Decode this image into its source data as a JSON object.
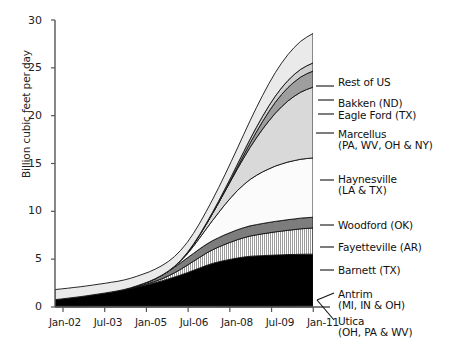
{
  "chart_data": {
    "type": "area",
    "stacked": true,
    "title": "",
    "xlabel": "",
    "ylabel": "Billion cubic feet per day",
    "ylim": [
      0,
      30
    ],
    "yticks": [
      0,
      5,
      10,
      15,
      20,
      25,
      30
    ],
    "ytick_labels": [
      "0",
      "5",
      "10",
      "15",
      "20",
      "25",
      "30"
    ],
    "xticks": [
      "Jan-02",
      "Jul-03",
      "Jan-05",
      "Jul-06",
      "Jan-08",
      "Jul-09",
      "Jan-11"
    ],
    "xtick_labels": [
      "Jan-02",
      "Jul-03",
      "Jan-05",
      "Jul-06",
      "Jan-08",
      "Jul-09",
      "Jan-11"
    ],
    "x_start": "Jan-02",
    "x_end": "Jul-12",
    "x_points": 42,
    "grid": false,
    "legend_position": "right-callout",
    "units": "Billion cubic feet per day",
    "series": [
      {
        "name": "Antrim (MI, IN & OH)",
        "label": "Antrim",
        "sublabel": "(MI, IN & OH)",
        "color": "#f2f2f2",
        "pattern": "solid",
        "values": [
          0.12,
          0.12,
          0.12,
          0.12,
          0.12,
          0.12,
          0.13,
          0.13,
          0.13,
          0.13,
          0.13,
          0.13,
          0.13,
          0.13,
          0.13,
          0.13,
          0.13,
          0.13,
          0.13,
          0.13,
          0.13,
          0.13,
          0.13,
          0.13,
          0.13,
          0.13,
          0.12,
          0.12,
          0.12,
          0.12,
          0.12,
          0.12,
          0.12,
          0.12,
          0.12,
          0.12,
          0.12,
          0.12,
          0.11,
          0.11,
          0.11,
          0.11
        ]
      },
      {
        "name": "Utica (OH, PA & WV)",
        "label": "Utica",
        "sublabel": "(OH, PA & WV)",
        "color": "#fafafa",
        "pattern": "solid",
        "values": [
          0,
          0,
          0,
          0,
          0,
          0,
          0,
          0,
          0,
          0,
          0,
          0,
          0,
          0,
          0,
          0,
          0,
          0,
          0,
          0,
          0,
          0,
          0,
          0,
          0,
          0,
          0,
          0,
          0,
          0,
          0,
          0,
          0,
          0,
          0,
          0.01,
          0.01,
          0.02,
          0.03,
          0.04,
          0.05,
          0.06
        ]
      },
      {
        "name": "Barnett (TX)",
        "label": "Barnett (TX)",
        "sublabel": "",
        "color": "#000000",
        "pattern": "solid",
        "values": [
          0.65,
          0.72,
          0.8,
          0.88,
          0.96,
          1.05,
          1.14,
          1.24,
          1.34,
          1.45,
          1.56,
          1.68,
          1.8,
          1.95,
          2.1,
          2.25,
          2.42,
          2.6,
          2.8,
          3.0,
          3.22,
          3.45,
          3.7,
          3.95,
          4.2,
          4.42,
          4.6,
          4.75,
          4.88,
          5.0,
          5.1,
          5.18,
          5.22,
          5.25,
          5.28,
          5.3,
          5.32,
          5.34,
          5.35,
          5.36,
          5.36,
          5.35
        ]
      },
      {
        "name": "Fayetteville (AR)",
        "label": "Fayetteville (AR)",
        "sublabel": "",
        "color": "#e8e8e8",
        "pattern": "vertical-stripes",
        "values": [
          0,
          0,
          0,
          0,
          0,
          0,
          0,
          0,
          0,
          0,
          0,
          0,
          0.02,
          0.04,
          0.07,
          0.1,
          0.15,
          0.22,
          0.32,
          0.45,
          0.6,
          0.78,
          0.95,
          1.12,
          1.28,
          1.42,
          1.55,
          1.68,
          1.8,
          1.92,
          2.02,
          2.12,
          2.2,
          2.28,
          2.35,
          2.42,
          2.48,
          2.54,
          2.6,
          2.66,
          2.7,
          2.74
        ]
      },
      {
        "name": "Woodford (OK)",
        "label": "Woodford (OK)",
        "sublabel": "",
        "color": "#7d7d7d",
        "pattern": "solid",
        "values": [
          0,
          0,
          0,
          0,
          0,
          0,
          0,
          0,
          0,
          0,
          0,
          0.02,
          0.05,
          0.09,
          0.14,
          0.2,
          0.28,
          0.38,
          0.48,
          0.58,
          0.68,
          0.76,
          0.82,
          0.88,
          0.92,
          0.95,
          0.98,
          1.0,
          1.02,
          1.04,
          1.05,
          1.06,
          1.07,
          1.08,
          1.09,
          1.1,
          1.1,
          1.11,
          1.11,
          1.12,
          1.12,
          1.12
        ]
      },
      {
        "name": "Haynesville (LA & TX)",
        "label": "Haynesville",
        "sublabel": "(LA & TX)",
        "color": "#fbfbfb",
        "pattern": "solid",
        "values": [
          0,
          0,
          0,
          0,
          0,
          0,
          0,
          0,
          0,
          0,
          0,
          0,
          0,
          0,
          0,
          0,
          0,
          0,
          0.02,
          0.08,
          0.2,
          0.42,
          0.75,
          1.15,
          1.6,
          2.1,
          2.62,
          3.15,
          3.65,
          4.1,
          4.5,
          4.85,
          5.15,
          5.4,
          5.6,
          5.78,
          5.92,
          6.02,
          6.1,
          6.15,
          6.18,
          6.2
        ]
      },
      {
        "name": "Marcellus (PA, WV, OH & NY)",
        "label": "Marcellus",
        "sublabel": "(PA, WV, OH & NY)",
        "color": "#d9d9d9",
        "pattern": "solid",
        "values": [
          0,
          0,
          0,
          0,
          0,
          0,
          0,
          0,
          0,
          0,
          0,
          0,
          0,
          0,
          0,
          0,
          0,
          0,
          0,
          0.02,
          0.05,
          0.1,
          0.18,
          0.3,
          0.48,
          0.72,
          1.02,
          1.38,
          1.8,
          2.28,
          2.8,
          3.35,
          3.92,
          4.48,
          5.02,
          5.52,
          5.98,
          6.38,
          6.72,
          7.0,
          7.22,
          7.4
        ]
      },
      {
        "name": "Eagle Ford (TX)",
        "label": "Eagle Ford (TX)",
        "sublabel": "",
        "color": "#9e9e9e",
        "pattern": "solid",
        "values": [
          0,
          0,
          0,
          0,
          0,
          0,
          0,
          0,
          0,
          0,
          0,
          0,
          0,
          0,
          0,
          0,
          0,
          0,
          0,
          0,
          0,
          0,
          0,
          0,
          0,
          0,
          0.02,
          0.05,
          0.1,
          0.18,
          0.3,
          0.45,
          0.62,
          0.8,
          0.98,
          1.14,
          1.28,
          1.4,
          1.5,
          1.58,
          1.64,
          1.68
        ]
      },
      {
        "name": "Bakken (ND)",
        "label": "Bakken (ND)",
        "sublabel": "",
        "color": "#cfcfcf",
        "pattern": "solid",
        "values": [
          0,
          0,
          0,
          0,
          0,
          0,
          0,
          0,
          0,
          0,
          0,
          0,
          0,
          0,
          0,
          0,
          0,
          0,
          0,
          0,
          0.01,
          0.02,
          0.04,
          0.06,
          0.09,
          0.12,
          0.16,
          0.2,
          0.25,
          0.3,
          0.36,
          0.42,
          0.48,
          0.54,
          0.6,
          0.65,
          0.7,
          0.74,
          0.78,
          0.81,
          0.83,
          0.85
        ]
      },
      {
        "name": "Rest of US",
        "label": "Rest of US",
        "sublabel": "",
        "color": "#eaeaea",
        "pattern": "solid",
        "values": [
          1.05,
          1.05,
          1.04,
          1.04,
          1.03,
          1.03,
          1.02,
          1.02,
          1.01,
          1.01,
          1.0,
          1.0,
          1.0,
          1.0,
          1.0,
          1.0,
          1.0,
          1.0,
          1.0,
          1.02,
          1.05,
          1.08,
          1.12,
          1.18,
          1.25,
          1.32,
          1.4,
          1.48,
          1.58,
          1.68,
          1.8,
          1.92,
          2.05,
          2.18,
          2.32,
          2.45,
          2.58,
          2.7,
          2.82,
          2.92,
          3.0,
          3.08
        ]
      }
    ],
    "total_start": 1.82,
    "total_end": 24.2
  },
  "legend_entries": [
    {
      "id": "rest-of-us",
      "line1": "Rest of US",
      "line2": ""
    },
    {
      "id": "bakken",
      "line1": "Bakken (ND)",
      "line2": ""
    },
    {
      "id": "eagle-ford",
      "line1": "Eagle Ford (TX)",
      "line2": ""
    },
    {
      "id": "marcellus",
      "line1": "Marcellus",
      "line2": "(PA, WV, OH & NY)"
    },
    {
      "id": "haynesville",
      "line1": "Haynesville",
      "line2": "(LA & TX)"
    },
    {
      "id": "woodford",
      "line1": "Woodford (OK)",
      "line2": ""
    },
    {
      "id": "fayetteville",
      "line1": "Fayetteville (AR)",
      "line2": ""
    },
    {
      "id": "barnett",
      "line1": "Barnett (TX)",
      "line2": ""
    },
    {
      "id": "antrim",
      "line1": "Antrim",
      "line2": "(MI, IN & OH)"
    },
    {
      "id": "utica",
      "line1": "Utica",
      "line2": "(OH, PA & WV)"
    }
  ],
  "axis": {
    "y_label": "Billion cubic feet per day",
    "y_ticks": [
      "30",
      "25",
      "20",
      "15",
      "10",
      "5",
      "0"
    ],
    "x_ticks": [
      "Jan-02",
      "Jul-03",
      "Jan-05",
      "Jul-06",
      "Jan-08",
      "Jul-09",
      "Jan-11"
    ]
  },
  "colors": {
    "axis": "#555555",
    "text": "#1a1a1a",
    "background": "#ffffff",
    "outline": "#000000"
  }
}
